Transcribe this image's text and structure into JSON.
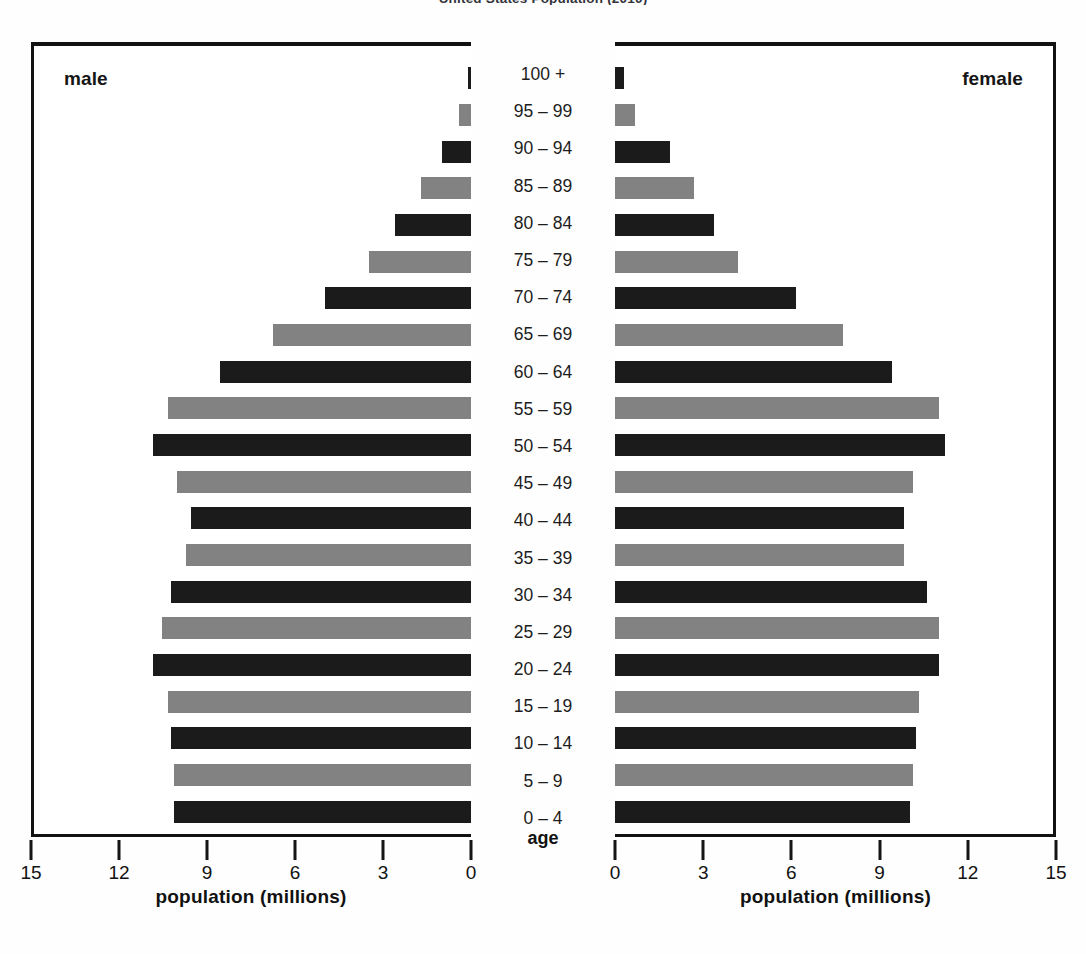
{
  "title": "United States Population (2010)",
  "panels": {
    "male_label": "male",
    "female_label": "female"
  },
  "age_axis_caption": "age",
  "axis": {
    "title": "population (millions)",
    "male_ticks": [
      "15",
      "12",
      "9",
      "6",
      "3",
      "0"
    ],
    "female_ticks": [
      "0",
      "3",
      "6",
      "9",
      "12",
      "15"
    ],
    "max": 15,
    "step": 3
  },
  "colors": {
    "bar_dark": "#1b1b1b",
    "bar_gray": "#828282",
    "frame": "#121212",
    "text": "#121212",
    "background": "#ffffff"
  },
  "chart_data": {
    "type": "bar",
    "subtype": "population-pyramid",
    "title": "United States Population (2010)",
    "xlabel": "population (millions)",
    "ylabel": "age",
    "xlim": [
      0,
      15
    ],
    "xticks": [
      0,
      3,
      6,
      9,
      12,
      15
    ],
    "grid": false,
    "legend": "panel-labels",
    "orientation": "horizontal-mirrored",
    "categories": [
      "100 +",
      "95 – 99",
      "90 – 94",
      "85 – 89",
      "80 – 84",
      "75 – 79",
      "70 – 74",
      "65 – 69",
      "60 – 64",
      "55 – 59",
      "50 – 54",
      "45 – 49",
      "40 – 44",
      "35 – 39",
      "30 – 34",
      "25 – 29",
      "20 – 24",
      "15 – 19",
      "10 – 14",
      "5 – 9",
      "0 – 4"
    ],
    "series": [
      {
        "name": "male",
        "direction": "left",
        "values": [
          0.1,
          0.4,
          1.0,
          1.7,
          2.6,
          3.5,
          5.0,
          6.8,
          8.6,
          10.4,
          10.9,
          10.1,
          9.6,
          9.8,
          10.3,
          10.6,
          10.9,
          10.4,
          10.3,
          10.2,
          10.2
        ]
      },
      {
        "name": "female",
        "direction": "right",
        "values": [
          0.3,
          0.7,
          1.9,
          2.7,
          3.4,
          4.2,
          6.2,
          7.8,
          9.5,
          11.1,
          11.3,
          10.2,
          9.9,
          9.9,
          10.7,
          11.1,
          11.1,
          10.4,
          10.3,
          10.2,
          10.1
        ]
      }
    ]
  }
}
